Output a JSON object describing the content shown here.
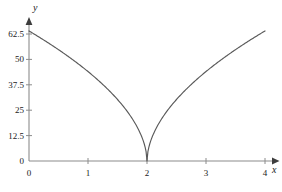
{
  "chart_data": {
    "type": "line",
    "title": "",
    "xlabel": "x",
    "ylabel": "y",
    "xlim": [
      -0.12,
      4.3
    ],
    "ylim": [
      0,
      72
    ],
    "grid": false,
    "legend": null,
    "x_ticks": [
      {
        "value": 0,
        "label": "0"
      },
      {
        "value": 1,
        "label": "1"
      },
      {
        "value": 2,
        "label": "2"
      },
      {
        "value": 3,
        "label": "3"
      },
      {
        "value": 4,
        "label": "4"
      }
    ],
    "y_ticks": [
      {
        "value": 0,
        "label": "0"
      },
      {
        "value": 12.5,
        "label": "12.5"
      },
      {
        "value": 25,
        "label": "25"
      },
      {
        "value": 37.5,
        "label": "37.5"
      },
      {
        "value": 50,
        "label": "50"
      },
      {
        "value": 62.5,
        "label": "62.5"
      }
    ],
    "series": [
      {
        "name": "curve",
        "color": "#595959",
        "cusp_x": 2,
        "cusp_y": 0,
        "x": [
          0,
          0.1,
          0.2,
          0.3,
          0.4,
          0.5,
          0.6,
          0.7,
          0.8,
          0.9,
          1,
          1.1,
          1.2,
          1.3,
          1.4,
          1.5,
          1.6,
          1.7,
          1.8,
          1.9,
          1.95,
          2,
          2.05,
          2.1,
          2.2,
          2.3,
          2.4,
          2.5,
          2.6,
          2.7,
          2.8,
          2.9,
          3,
          3.1,
          3.2,
          3.3,
          3.4,
          3.5,
          3.6,
          3.7,
          3.8,
          3.9,
          4
        ],
        "y": [
          64,
          62.2,
          60.4,
          58.5,
          56.5,
          54.5,
          52.3,
          50.1,
          47.7,
          45.2,
          44,
          41.2,
          38.3,
          35.2,
          31.8,
          30.3,
          26.2,
          22,
          17.3,
          11.9,
          8.2,
          0,
          8.2,
          11.9,
          17.3,
          22,
          26.2,
          30.3,
          34.2,
          37.9,
          41.4,
          44.8,
          44,
          47.7,
          50.1,
          52.3,
          54.5,
          56.5,
          58.5,
          60.4,
          62.2,
          63.1,
          64
        ]
      }
    ],
    "axis_color": "#8c8c8c",
    "curve_color": "#595959",
    "text_color": "#1a1a1a"
  }
}
